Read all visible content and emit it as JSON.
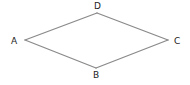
{
  "diagram": {
    "shape": "rhombus",
    "vertices": [
      {
        "id": "A",
        "label": "A"
      },
      {
        "id": "D",
        "label": "D"
      },
      {
        "id": "C",
        "label": "C"
      },
      {
        "id": "B",
        "label": "B"
      }
    ],
    "edges": [
      {
        "from": "A",
        "to": "D"
      },
      {
        "from": "D",
        "to": "C"
      },
      {
        "from": "C",
        "to": "B"
      },
      {
        "from": "B",
        "to": "A"
      }
    ],
    "colors": {
      "edge": "#8a8a8a",
      "label": "#222222"
    }
  }
}
